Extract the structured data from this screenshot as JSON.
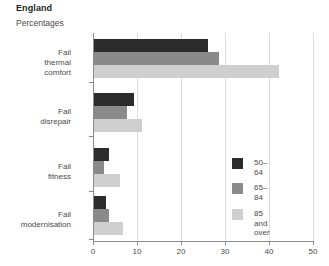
{
  "header": {
    "title": "England",
    "subtitle": "Percentages"
  },
  "legend": {
    "items": [
      {
        "label": "50–64",
        "color": "#2b2b2b"
      },
      {
        "label": "65–84",
        "color": "#8a8a8a"
      },
      {
        "label": "85 and\nover",
        "color": "#cfcfcf"
      }
    ]
  },
  "axis": {
    "x_ticks": [
      "0",
      "10",
      "20",
      "30",
      "40",
      "50"
    ],
    "y_labels": [
      "Fail thermal\ncomfort",
      "Fail disrepair",
      "Fail fitness",
      "Fail modernisation"
    ]
  },
  "chart_data": {
    "type": "bar",
    "orientation": "horizontal",
    "title": "England",
    "subtitle": "Percentages",
    "xlabel": "",
    "ylabel": "",
    "xlim": [
      0,
      50
    ],
    "xticks": [
      0,
      10,
      20,
      30,
      40,
      50
    ],
    "grid": true,
    "legend_position": "inside-right",
    "categories": [
      "Fail thermal comfort",
      "Fail disrepair",
      "Fail fitness",
      "Fail modernisation"
    ],
    "series": [
      {
        "name": "50–64",
        "color": "#2b2b2b",
        "values": [
          26,
          9,
          3.5,
          2.7
        ]
      },
      {
        "name": "65–84",
        "color": "#8a8a8a",
        "values": [
          28.5,
          7.5,
          2.3,
          3.5
        ]
      },
      {
        "name": "85 and over",
        "color": "#cfcfcf",
        "values": [
          42,
          11,
          6,
          6.7
        ]
      }
    ]
  }
}
